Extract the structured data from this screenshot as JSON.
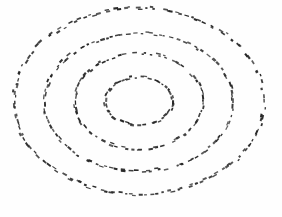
{
  "figure": {
    "title": "",
    "background_color": "#fefefe",
    "width": 282,
    "height": 217
  },
  "chart_data": {
    "type": "scatter",
    "title": "",
    "subtitle": "",
    "xlabel": "",
    "ylabel": "",
    "legend": [],
    "grid": false,
    "axes_visible": false,
    "tick_labels": [],
    "annotations": [],
    "xlim": [
      0,
      282
    ],
    "ylim": [
      0,
      217
    ],
    "marker": {
      "shape": "dash",
      "color": "#262626",
      "length_px": 3.2,
      "thickness_px": 1.6
    },
    "series": [
      {
        "name": "ring-1-outer",
        "kind": "ellipse-outline",
        "center": [
          139,
          101
        ],
        "rx": 125,
        "ry": 93,
        "n_points": 150,
        "jitter_px": 1.6,
        "color": "#262626",
        "bbox": [
          14,
          8,
          264,
          194
        ]
      },
      {
        "name": "ring-2",
        "kind": "ellipse-outline",
        "center": [
          139,
          102
        ],
        "rx": 94,
        "ry": 69,
        "n_points": 118,
        "jitter_px": 1.5,
        "color": "#262626",
        "bbox": [
          45,
          33,
          233,
          171
        ]
      },
      {
        "name": "ring-3",
        "kind": "ellipse-outline",
        "center": [
          139,
          101
        ],
        "rx": 64,
        "ry": 48,
        "n_points": 86,
        "jitter_px": 1.4,
        "color": "#262626",
        "bbox": [
          75,
          53,
          203,
          149
        ]
      },
      {
        "name": "ring-4-inner",
        "kind": "ellipse-outline",
        "center": [
          139,
          101
        ],
        "rx": 34,
        "ry": 24,
        "n_points": 54,
        "jitter_px": 1.2,
        "color": "#262626",
        "bbox": [
          105,
          77,
          173,
          125
        ]
      }
    ]
  }
}
